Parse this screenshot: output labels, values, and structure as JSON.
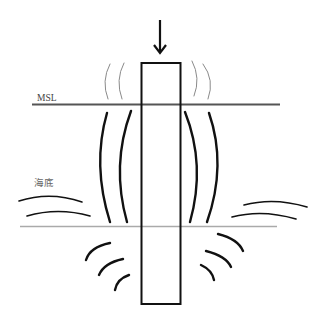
{
  "diagram": {
    "type": "pile-driving-vibration-propagation",
    "labels": {
      "sea_level": "MSL",
      "seabed": "海底"
    },
    "colors": {
      "background": "#ffffff",
      "pile_stroke": "#111111",
      "msl_line": "#555555",
      "seabed_line": "#aaaaaa",
      "thick_waves": "#111111",
      "thin_waves": "#8a8a8a",
      "text_msl": "#444444",
      "text_seabed": "#666666"
    },
    "elements": [
      {
        "id": "force-arrow",
        "description": "downward arrow pushing the pile"
      },
      {
        "id": "pile",
        "description": "vertical rectangular pile"
      },
      {
        "id": "msl-line",
        "description": "mean sea level line"
      },
      {
        "id": "seabed-line",
        "description": "seabed line"
      },
      {
        "id": "airborne-waves",
        "description": "thin gray arcs above MSL (airborne sound)"
      },
      {
        "id": "waterborne-waves",
        "description": "thick arcs between MSL and seabed (underwater sound)"
      },
      {
        "id": "seabed-surface-waves",
        "description": "horizontal arcs near seabed surface"
      },
      {
        "id": "ground-waves",
        "description": "short arcs below seabed (ground-borne vibration)"
      }
    ]
  }
}
